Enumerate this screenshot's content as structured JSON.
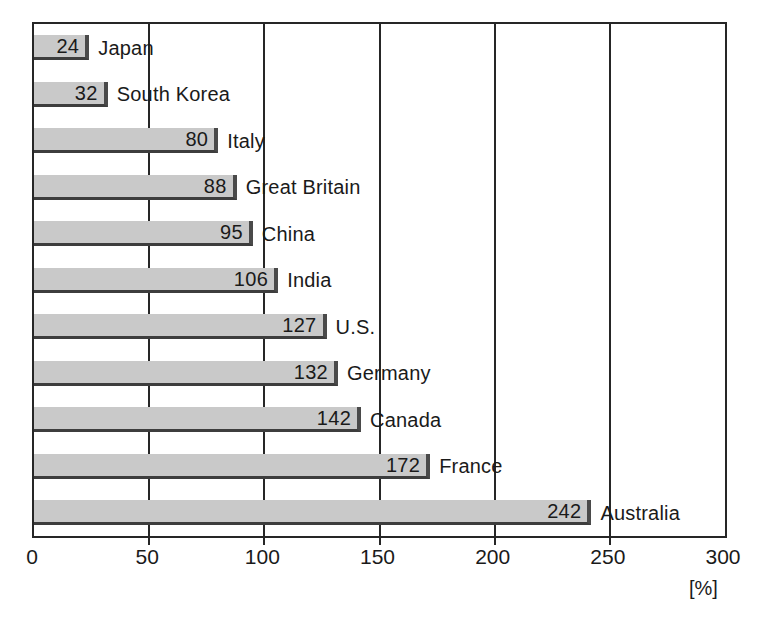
{
  "chart_data": {
    "type": "bar",
    "orientation": "horizontal",
    "title": "",
    "subtitle": "",
    "xlabel": "[%]",
    "ylabel": "",
    "unit": "[%]",
    "xlim": [
      0,
      300
    ],
    "xticks": [
      0,
      50,
      100,
      150,
      200,
      250,
      300
    ],
    "xticklabels": [
      "0",
      "50",
      "100",
      "150",
      "200",
      "250",
      "300"
    ],
    "gridlines": [
      50,
      100,
      150,
      200,
      250
    ],
    "grid": true,
    "legend": null,
    "legend_position": "none",
    "categories": [
      "Japan",
      "South Korea",
      "Italy",
      "Great Britain",
      "China",
      "India",
      "U.S.",
      "Germany",
      "Canada",
      "France",
      "Australia"
    ],
    "values": [
      24,
      32,
      80,
      88,
      95,
      106,
      127,
      132,
      142,
      172,
      242
    ],
    "bars": [
      {
        "label": "Japan",
        "value": 24,
        "value_text": "24"
      },
      {
        "label": "South Korea",
        "value": 32,
        "value_text": "32"
      },
      {
        "label": "Italy",
        "value": 80,
        "value_text": "80"
      },
      {
        "label": "Great Britain",
        "value": 88,
        "value_text": "88"
      },
      {
        "label": "China",
        "value": 95,
        "value_text": "95"
      },
      {
        "label": "India",
        "value": 106,
        "value_text": "106"
      },
      {
        "label": "U.S.",
        "value": 127,
        "value_text": "127"
      },
      {
        "label": "Germany",
        "value": 132,
        "value_text": "132"
      },
      {
        "label": "Canada",
        "value": 142,
        "value_text": "142"
      },
      {
        "label": "France",
        "value": 172,
        "value_text": "172"
      },
      {
        "label": "Australia",
        "value": 242,
        "value_text": "242"
      }
    ]
  },
  "style": {
    "bar_fill": "#c9c9c9",
    "bar_edge_right": "#4a4a4a",
    "bar_edge_bottom": "#3d3d3d",
    "frame_color": "#262626",
    "gridline_color": "#262626",
    "text_color": "#1a1a1a",
    "background": "#ffffff"
  }
}
